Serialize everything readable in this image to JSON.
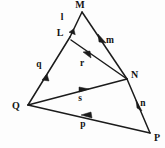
{
  "diagram": {
    "background_color": "#fdfdfd",
    "ink_color": "#1b1b1b",
    "vertices": [
      {
        "name": "M",
        "label": "M",
        "x": 82,
        "y": 12,
        "label_x": 80,
        "label_y": 8
      },
      {
        "name": "L",
        "label": "L",
        "x": 70,
        "y": 37,
        "label_x": 60,
        "label_y": 36
      },
      {
        "name": "Q",
        "label": "Q",
        "x": 28,
        "y": 105,
        "label_x": 16,
        "label_y": 109
      },
      {
        "name": "N",
        "label": "N",
        "x": 127,
        "y": 79,
        "label_x": 131,
        "label_y": 78
      },
      {
        "name": "P",
        "label": "P",
        "x": 150,
        "y": 133,
        "label_x": 154,
        "label_y": 141
      }
    ],
    "segments": [
      {
        "name": "l",
        "label": "l",
        "from": "M",
        "to": "L",
        "label_x": 62,
        "label_y": 20
      },
      {
        "name": "q",
        "label": "q",
        "from": "L",
        "to": "Q",
        "label_x": 39,
        "label_y": 67
      },
      {
        "name": "m",
        "label": "m",
        "from": "M",
        "to": "N",
        "label_x": 110,
        "label_y": 43
      },
      {
        "name": "r",
        "label": "r",
        "from": "N",
        "to": "L",
        "label_x": 82,
        "label_y": 66
      },
      {
        "name": "s",
        "label": "s",
        "from": "Q",
        "to": "N",
        "label_x": 80,
        "label_y": 101
      },
      {
        "name": "n",
        "label": "n",
        "from": "N",
        "to": "P",
        "label_x": 143,
        "label_y": 106
      },
      {
        "name": "p",
        "label": "p",
        "from": "P",
        "to": "Q",
        "label_x": 83,
        "label_y": 127
      }
    ]
  }
}
